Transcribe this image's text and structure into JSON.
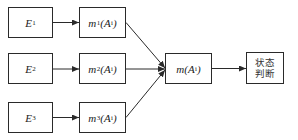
{
  "diagram": {
    "sources": [
      {
        "label": "E",
        "sub": "1"
      },
      {
        "label": "E",
        "sub": "2"
      },
      {
        "label": "E",
        "sub": "3"
      }
    ],
    "mass_functions": [
      {
        "label": "m",
        "sub": "1",
        "arg": "(A",
        "arg_sub": "i",
        "close": ")"
      },
      {
        "label": "m",
        "sub": "2",
        "arg": "(A",
        "arg_sub": "i",
        "close": ")"
      },
      {
        "label": "m",
        "sub": "3",
        "arg": "(A",
        "arg_sub": "i",
        "close": ")"
      }
    ],
    "fusion": {
      "label": "m",
      "arg": "(A",
      "arg_sub": "i",
      "close": ")"
    },
    "decision": {
      "line1": "状态",
      "line2": "判断"
    }
  }
}
